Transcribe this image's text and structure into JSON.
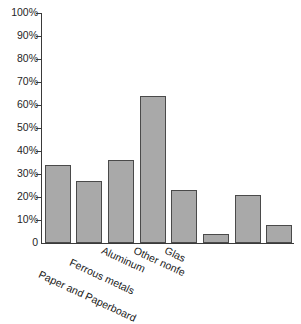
{
  "chart_data": {
    "type": "bar",
    "title": "",
    "title_fragment": "",
    "xlabel": "",
    "ylabel": "",
    "ylim": [
      0,
      100
    ],
    "grid": false,
    "legend": "none",
    "categories": [
      "Paper and Paperboard",
      "Ferrous metals",
      "Aluminum",
      "Other nonfe",
      "Glas",
      "",
      "",
      ""
    ],
    "values": [
      34,
      27,
      36,
      64,
      23,
      4,
      21,
      8
    ],
    "ytick_labels": [
      "100%",
      "90%",
      "80%",
      "70%",
      "60%",
      "50%",
      "40%",
      "30%",
      "20%",
      "10%",
      "0"
    ],
    "ytick_values": [
      100,
      90,
      80,
      70,
      60,
      50,
      40,
      30,
      20,
      10,
      0
    ],
    "bar_color": "#a9a9a9",
    "bar_border_color": "#4a4a4a",
    "axis_color": "#3a3a3a"
  },
  "xlabels": [
    {
      "text": "Paper and Paperboard",
      "row": 2,
      "fade": 0
    },
    {
      "text": "Ferrous metals",
      "row": 1,
      "fade": 0
    },
    {
      "text": "Aluminum",
      "row": 0,
      "fade": 0
    },
    {
      "text": "Other nonfe",
      "row": 0,
      "fade": 0
    },
    {
      "text": "Glas",
      "row": 0,
      "fade": 0
    },
    {
      "text": "",
      "row": 0,
      "fade": 2
    },
    {
      "text": "",
      "row": 0,
      "fade": 2
    },
    {
      "text": "",
      "row": 0,
      "fade": 3
    }
  ]
}
